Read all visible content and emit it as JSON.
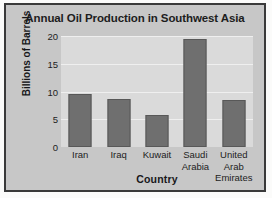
{
  "chart_data": {
    "type": "bar",
    "title": "Annual Oil Production in Southwest Asia",
    "xlabel": "Country",
    "ylabel": "Billions of Barrels",
    "categories": [
      "Iran",
      "Iraq",
      "Kuwait",
      "Saudi\nArabia",
      "United\nArab\nEmirates"
    ],
    "values": [
      9.6,
      8.7,
      5.8,
      19.5,
      8.5
    ],
    "yticks": [
      0,
      5,
      10,
      15,
      20
    ],
    "ylim": [
      0,
      20
    ],
    "grid": true,
    "legend": null,
    "colors": {
      "bar": "#6f6f6f",
      "bar_edge": "#585858",
      "plot_background": "#dadada",
      "card_background": "#c7c7c7",
      "page_background": "#fbfbfa",
      "frame": "#3a3a3a",
      "gridline": "#efefef",
      "text": "#1d1d1d"
    }
  }
}
